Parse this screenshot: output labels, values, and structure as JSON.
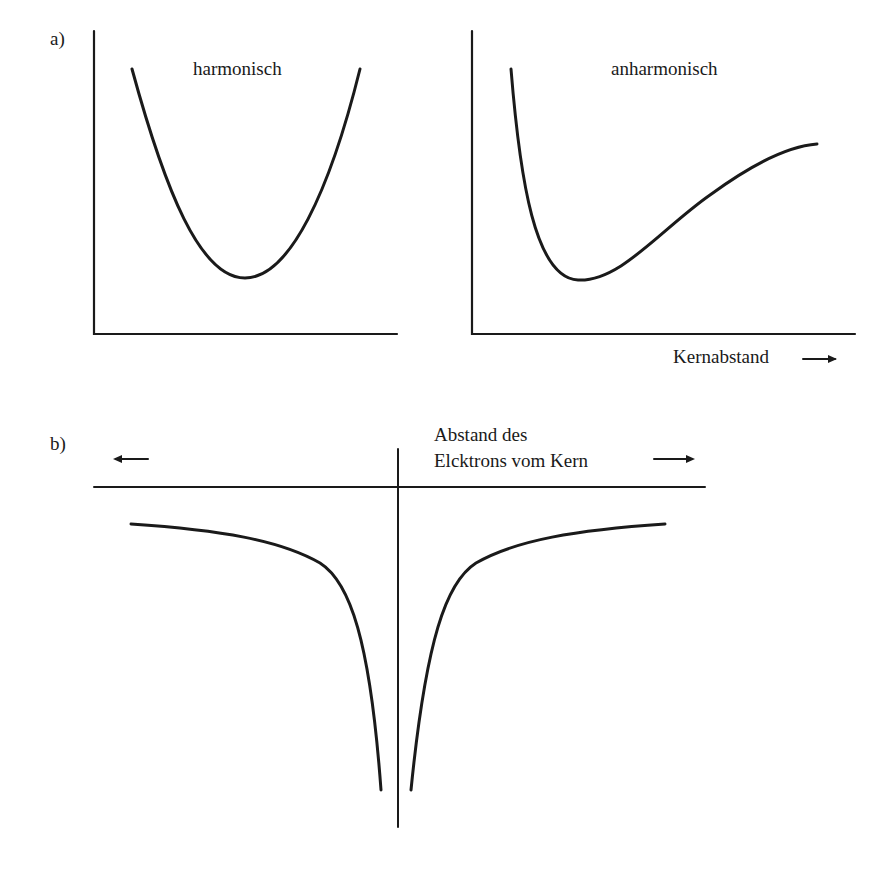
{
  "panel_a": {
    "label": "a)",
    "left_plot": {
      "title": "harmonisch"
    },
    "right_plot": {
      "title": "anharmonisch",
      "xlabel": "Kernabstand",
      "xlabel_arrow": "right-arrow"
    }
  },
  "panel_b": {
    "label": "b)",
    "axis_label_line1": "Abstand des",
    "axis_label_line2": "Elcktrons vom Kern",
    "left_arrow": "left-arrow",
    "right_arrow": "right-arrow"
  },
  "colors": {
    "line": "#1a1a1a",
    "background": "#ffffff"
  }
}
